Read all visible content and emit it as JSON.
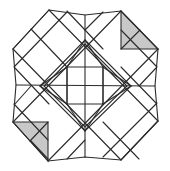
{
  "diagram": {
    "type": "geometric-tiling-figure",
    "colors": {
      "line": "#2a2a2a",
      "shade": "#c8c8c8",
      "background": "#ffffff"
    },
    "outer_polygon": [
      [
        49,
        10
      ],
      [
        85,
        15
      ],
      [
        121,
        11
      ],
      [
        158,
        49
      ],
      [
        155,
        86
      ],
      [
        158,
        121
      ],
      [
        121,
        160
      ],
      [
        85,
        157
      ],
      [
        48,
        161
      ],
      [
        13,
        122
      ],
      [
        16,
        85
      ],
      [
        13,
        49
      ]
    ],
    "shaded_triangles": [
      {
        "name": "top-right",
        "points": [
          [
            121,
            11
          ],
          [
            158,
            49
          ],
          [
            121,
            49
          ]
        ],
        "inner_line": [
          [
            121,
            49
          ],
          [
            140,
            30
          ]
        ]
      },
      {
        "name": "bottom-left",
        "points": [
          [
            48,
            161
          ],
          [
            13,
            122
          ],
          [
            48,
            122
          ]
        ],
        "inner_line": [
          [
            48,
            122
          ],
          [
            30,
            141
          ]
        ]
      }
    ],
    "center": [
      85,
      86
    ],
    "inner_square": [
      [
        67,
        67
      ],
      [
        103,
        67
      ],
      [
        103,
        104
      ],
      [
        67,
        104
      ]
    ],
    "inner_diamond": [
      [
        85,
        40
      ],
      [
        131,
        86
      ],
      [
        85,
        131
      ],
      [
        40,
        86
      ]
    ]
  }
}
